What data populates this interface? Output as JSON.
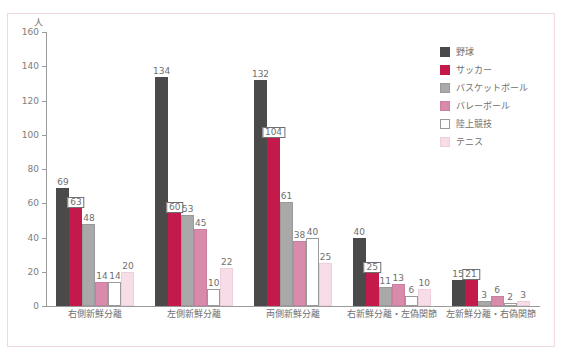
{
  "axis": {
    "unit_label": "人",
    "y_ticks": [
      0,
      20,
      40,
      60,
      80,
      100,
      120,
      140,
      160
    ]
  },
  "legend": {
    "items": [
      {
        "label": "野球",
        "color": "#4a4a4a",
        "border": "#4a4a4a"
      },
      {
        "label": "サッカー",
        "color": "#c4194b",
        "border": "#c4194b"
      },
      {
        "label": "バスケットボール",
        "color": "#a9a9a9",
        "border": "#a9a9a9"
      },
      {
        "label": "バレーボール",
        "color": "#d branch",
        "border": "#c98aa6"
      }
    ]
  },
  "chart_data": {
    "type": "bar",
    "title": "",
    "xlabel": "",
    "ylabel": "人",
    "ylim": [
      0,
      160
    ],
    "ytick_step": 20,
    "grid": false,
    "legend_position": "right",
    "categories": [
      "右側新鮮分離",
      "左側新鮮分離",
      "両側新鮮分離",
      "右新鮮分離・左偽関節",
      "左新鮮分離・右偽関節"
    ],
    "series": [
      {
        "name": "野球",
        "color": "#4a4a4a",
        "border": "#4a4a4a",
        "values": [
          69,
          134,
          132,
          40,
          15
        ]
      },
      {
        "name": "サッカー",
        "color": "#c4194b",
        "border": "#c4194b",
        "values": [
          63,
          60,
          104,
          25,
          21
        ]
      },
      {
        "name": "バスケットボール",
        "color": "#a9a9a9",
        "border": "#9a9a9a",
        "values": [
          48,
          53,
          61,
          11,
          3
        ]
      },
      {
        "name": "バレーボール",
        "color": "#d98bab",
        "border": "#c97fa0",
        "values": [
          14,
          45,
          38,
          13,
          6
        ]
      },
      {
        "name": "陸上競技",
        "color": "#ffffff",
        "border": "#9a9a9a",
        "values": [
          14,
          10,
          40,
          6,
          2
        ]
      },
      {
        "name": "テニス",
        "color": "#f7dde8",
        "border": "#eccfdb",
        "values": [
          20,
          22,
          25,
          10,
          3
        ]
      }
    ],
    "boxed_labels": [
      {
        "series": "サッカー",
        "category": "右側新鮮分離",
        "value": 63
      },
      {
        "series": "サッカー",
        "category": "左側新鮮分離",
        "value": 60
      },
      {
        "series": "サッカー",
        "category": "両側新鮮分離",
        "value": 104
      },
      {
        "series": "サッカー",
        "category": "右新鮮分離・左偽関節",
        "value": 25
      },
      {
        "series": "サッカー",
        "category": "左新鮮分離・右偽関節",
        "value": 21
      }
    ]
  }
}
